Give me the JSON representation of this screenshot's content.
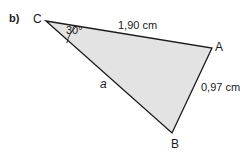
{
  "figure": {
    "item_marker": "b)",
    "shape": "triangle",
    "fill_color": "#e3e3e3",
    "stroke_color": "#1a1a1a",
    "background_color": "#ffffff",
    "vertices": [
      {
        "name": "C",
        "label": "C",
        "x": 46,
        "y": 21
      },
      {
        "name": "A",
        "label": "A",
        "x": 212,
        "y": 48
      },
      {
        "name": "B",
        "label": "B",
        "x": 172,
        "y": 133
      }
    ],
    "angles": [
      {
        "at_vertex": "C",
        "label": "30°",
        "value": 30,
        "unit": "degree"
      }
    ],
    "sides": [
      {
        "name": "CA",
        "label": "1,90 cm",
        "value": "1,90",
        "unit": "cm"
      },
      {
        "name": "AB",
        "label": "0,97 cm",
        "value": "0,97",
        "unit": "cm"
      },
      {
        "name": "CB",
        "label": "a",
        "value": "",
        "unit": ""
      }
    ]
  }
}
